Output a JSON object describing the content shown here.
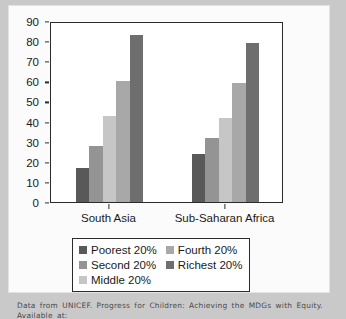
{
  "figure": {
    "background_color": "#c9c9c9",
    "panel_color": "#fbfbfb"
  },
  "caption": {
    "text": "Data from UNICEF. Progress for Children: Achieving the MDGs with Equity. Available at:"
  },
  "legend": {
    "items": [
      {
        "label": "Poorest 20%",
        "color": "#595959"
      },
      {
        "label": "Fourth 20%",
        "color": "#a8a8a8"
      },
      {
        "label": "Second 20%",
        "color": "#949494"
      },
      {
        "label": "Richest 20%",
        "color": "#6e6e6e"
      },
      {
        "label": "Middle 20%",
        "color": "#c6c6c6"
      }
    ]
  },
  "chart_data": {
    "type": "bar",
    "title": "",
    "xlabel": "",
    "ylabel": "",
    "ylim": [
      0,
      90
    ],
    "yticks": [
      0,
      10,
      20,
      30,
      40,
      50,
      60,
      70,
      80,
      90
    ],
    "grid": false,
    "legend_position": "below",
    "categories": [
      "South Asia",
      "Sub-Saharan Africa"
    ],
    "series": [
      {
        "name": "Poorest 20%",
        "color": "#595959",
        "values": [
          17,
          24
        ]
      },
      {
        "name": "Second 20%",
        "color": "#949494",
        "values": [
          28,
          32
        ]
      },
      {
        "name": "Middle 20%",
        "color": "#c6c6c6",
        "values": [
          43,
          42
        ]
      },
      {
        "name": "Fourth 20%",
        "color": "#a8a8a8",
        "values": [
          60,
          59
        ]
      },
      {
        "name": "Richest 20%",
        "color": "#6e6e6e",
        "values": [
          83,
          79
        ]
      }
    ]
  }
}
